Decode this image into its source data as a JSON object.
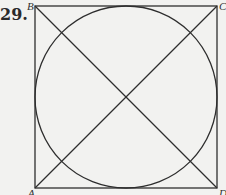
{
  "problem": {
    "number": "29.",
    "labels": {
      "top_left": "B",
      "top_right": "C",
      "bottom_left": "A",
      "bottom_right": "D"
    }
  },
  "figure": {
    "stroke_color": "#2e2e2e",
    "background": "#f2f2f0"
  }
}
